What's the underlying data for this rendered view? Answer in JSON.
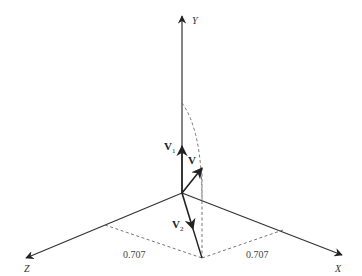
{
  "diagram": {
    "axes": {
      "x_label": "X",
      "y_label": "Y",
      "z_label": "Z"
    },
    "vectors": {
      "v_label": "V",
      "v1_label": "V",
      "v1_sub": "1",
      "v2_label": "V",
      "v2_sub": "2"
    },
    "projections": {
      "z_component": "0.707",
      "x_component": "0.707"
    },
    "colors": {
      "line": "#333333",
      "dashed": "#666666"
    }
  }
}
